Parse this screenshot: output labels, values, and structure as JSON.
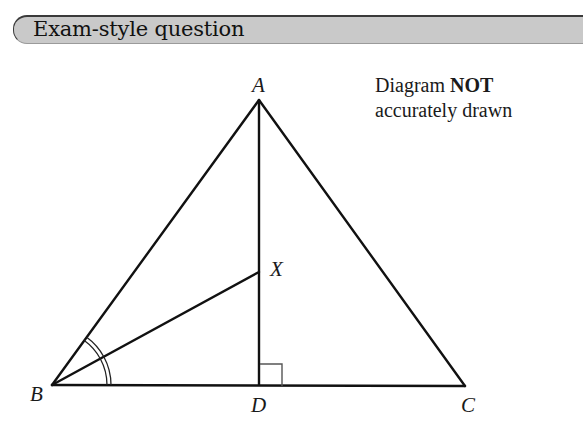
{
  "header": {
    "title": "Exam-style question"
  },
  "note": {
    "line1_prefix": "Diagram ",
    "line1_bold": "NOT",
    "line2": "accurately drawn"
  },
  "diagram": {
    "vertices": {
      "A": {
        "label": "A",
        "x": 259,
        "y": 100
      },
      "B": {
        "label": "B",
        "x": 52,
        "y": 385
      },
      "C": {
        "label": "C",
        "x": 465,
        "y": 386
      },
      "D": {
        "label": "D",
        "x": 259,
        "y": 386
      },
      "X": {
        "label": "X",
        "x": 259,
        "y": 272
      }
    },
    "segments": [
      "AB",
      "AC",
      "BC",
      "AD",
      "BX"
    ],
    "marks": {
      "right_angle": "ADB",
      "equal_angles": [
        "ABX",
        "XBD"
      ]
    },
    "colors": {
      "line": "#111111",
      "header_bg": "#c9c9c9",
      "header_border": "#3a3a3a"
    }
  }
}
